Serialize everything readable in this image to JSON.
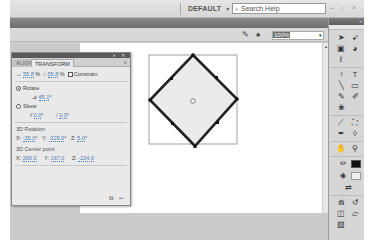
{
  "titlebar": {
    "workspace_label": "DEFAULT",
    "workspace_arrow": "▼",
    "search_icon": "⌕",
    "search_placeholder": "Search Help",
    "window_controls": "– ▫ ×"
  },
  "editbar": {
    "edit_symbols_icon": "✎",
    "edit_scene_icon": "♠",
    "zoom_value": "100%",
    "zoom_dropdown": "▾"
  },
  "transform_panel": {
    "header_controls": "» ✕",
    "tabs": [
      {
        "label": "ALIGN",
        "active": false
      },
      {
        "label": "TRANSFORM",
        "active": true
      }
    ],
    "menu_icon": "≡",
    "width_icon": "↔",
    "width_value": "55.8",
    "height_icon": "↕",
    "height_value": "55.8",
    "percent": "%",
    "constrain_label": "Constrain",
    "rotate_label": "Rotate",
    "rotate_value": "45.1",
    "degree": "°",
    "skew_label": "Skew",
    "skew_h_value": "0.0",
    "skew_v_value": "0.0",
    "rotation3d": {
      "title": "3D Rotation",
      "x_label": "X:",
      "x_value": "-25.0",
      "y_label": "Y:",
      "y_value": "-229.0",
      "z_label": "Z:",
      "z_value": "5.0"
    },
    "center3d": {
      "title": "3D Center point",
      "x_label": "X:",
      "x_value": "269.0",
      "y_label": "Y:",
      "y_value": "167.0",
      "z_label": "Z:",
      "z_value": "-224.0"
    },
    "footer_icons": "⧉ ↩"
  },
  "tools_panel": {
    "header_controls": "»",
    "tools": [
      {
        "name": "selection",
        "glyph": "➤"
      },
      {
        "name": "subselection",
        "glyph": "➹"
      },
      {
        "name": "free-transform",
        "glyph": "▣"
      },
      {
        "name": "3d-rotation",
        "glyph": "◕"
      },
      {
        "name": "lasso",
        "glyph": "ℓ"
      },
      {
        "name": "pen",
        "glyph": "♮"
      },
      {
        "name": "text",
        "glyph": "T"
      },
      {
        "name": "line",
        "glyph": "╲"
      },
      {
        "name": "rectangle",
        "glyph": "▭"
      },
      {
        "name": "pencil",
        "glyph": "✎"
      },
      {
        "name": "brush",
        "glyph": "✐"
      },
      {
        "name": "deco",
        "glyph": "❀"
      },
      {
        "name": "bone",
        "glyph": "⟋"
      },
      {
        "name": "paint-bucket",
        "glyph": "⛶"
      },
      {
        "name": "eyedropper",
        "glyph": "✒"
      },
      {
        "name": "eraser",
        "glyph": "◊"
      },
      {
        "name": "hand",
        "glyph": "✋"
      },
      {
        "name": "zoom",
        "glyph": "⚲"
      },
      {
        "name": "stroke-color",
        "glyph": "✏"
      },
      {
        "name": "fill-color",
        "glyph": "◈"
      },
      {
        "name": "swap-colors",
        "glyph": "⇄"
      },
      {
        "name": "snap-to-objects",
        "glyph": "⋒"
      },
      {
        "name": "smooth",
        "glyph": "↺"
      },
      {
        "name": "straighten",
        "glyph": "▱"
      },
      {
        "name": "object-drawing",
        "glyph": "◫"
      }
    ],
    "stroke_color": "#111111",
    "fill_color": "#eeeeee"
  },
  "stage": {
    "shape": "rotated-square",
    "shape_fill": "#ebebeb",
    "shape_stroke": "#222222"
  }
}
